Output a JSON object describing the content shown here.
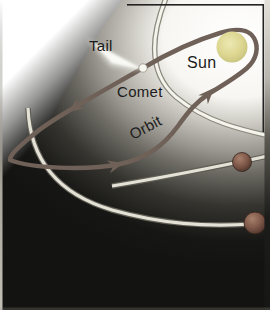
{
  "figure": {
    "labels": {
      "tail": "Tail",
      "sun": "Sun",
      "comet": "Comet",
      "orbit": "Orbit"
    },
    "objects": {
      "sun": {
        "label": "Sun",
        "fill": "#ddd792"
      },
      "comet": {
        "label": "Comet",
        "head_fill": "#f7f6ef",
        "tail_fill": "#fbfbf7"
      },
      "comet_orbit": {
        "label": "Orbit",
        "stroke": "#6f6158",
        "direction_arrow_count": 3
      },
      "planets": [
        {
          "name": "inner-planet",
          "fill": "#7d5748"
        },
        {
          "name": "outer-planet",
          "fill": "#744c3e"
        }
      ],
      "planet_orbit_band_count": 2,
      "sun_halo_ring_count": 1
    },
    "colors": {
      "background_dark": "#131311",
      "panel_white": "#ffffff",
      "orbit_band": "#e4e2d6",
      "frame_line": "#222222"
    }
  }
}
